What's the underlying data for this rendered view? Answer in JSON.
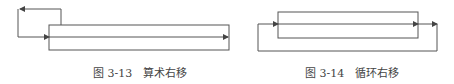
{
  "figures": [
    {
      "id": "fig-3-13",
      "caption_number": "图 3-13",
      "caption_title": "算术右移",
      "description": "Arithmetic right shift: register with sign bit fed back into itself, output shifted out right"
    },
    {
      "id": "fig-3-14",
      "caption_number": "图 3-14",
      "caption_title": "循环右移",
      "description": "Circular right shift: register output loops back around to input"
    }
  ],
  "colors": {
    "line": "#555555",
    "caption": "#444444",
    "background": "#ffffff"
  }
}
